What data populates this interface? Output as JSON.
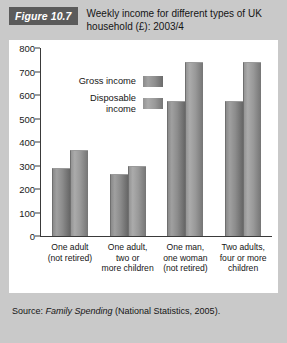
{
  "figure": {
    "badge": "Figure 10.7",
    "title": "Weekly income for different types of UK household (£): 2003/4",
    "source_prefix": "Source: ",
    "source_italic": "Family Spending",
    "source_suffix": " (National Statistics, 2005)."
  },
  "chart_data": {
    "type": "bar",
    "title": "Weekly income for different types of UK household (£): 2003/4",
    "xlabel": "",
    "ylabel": "",
    "ylim": [
      0,
      800
    ],
    "yticks": [
      0,
      100,
      200,
      300,
      400,
      500,
      600,
      700,
      800
    ],
    "ytick_labels": [
      "0",
      "100",
      "200",
      "300",
      "400",
      "500",
      "600",
      "700",
      "800"
    ],
    "grid": false,
    "legend_position": "upper-left-inside",
    "categories": [
      "One adult (not retired)",
      "One adult, two or more children",
      "One man, one woman (not retired)",
      "Two adults, four or more children"
    ],
    "category_lines": [
      [
        "One adult",
        "(not retired)"
      ],
      [
        "One adult,",
        "two or",
        "more children"
      ],
      [
        "One man,",
        "one woman",
        "(not retired)"
      ],
      [
        "Two adults,",
        "four or more",
        "children"
      ]
    ],
    "series": [
      {
        "name": "Gross income",
        "color": "#8a8a8a",
        "values": [
          285,
          258,
          570,
          570
        ]
      },
      {
        "name": "Disposable income",
        "color": "#9a9a9a",
        "values": [
          360,
          293,
          735,
          735
        ]
      }
    ],
    "legend": [
      "Gross income",
      "Disposable income"
    ]
  },
  "legend_labels": {
    "gross": "Gross income",
    "disposable_line1": "Disposable",
    "disposable_line2": "income"
  },
  "colors": {
    "page_background": "#c9c9c9",
    "panel_background": "#ffffff",
    "badge_background": "#5b5b5b",
    "badge_text": "#ffffff",
    "axis": "#3a3a3a",
    "text": "#151515"
  }
}
